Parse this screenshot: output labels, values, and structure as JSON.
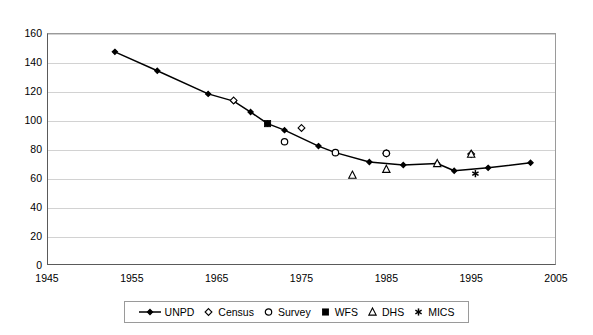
{
  "chart_data": {
    "type": "line",
    "title": "",
    "subtitle": "",
    "xlabel": "",
    "ylabel": "",
    "xlim": [
      1945,
      2005
    ],
    "ylim": [
      0,
      160
    ],
    "xticks": [
      1945,
      1955,
      1965,
      1975,
      1985,
      1995,
      2005
    ],
    "yticks": [
      0,
      20,
      40,
      60,
      80,
      100,
      120,
      140,
      160
    ],
    "grid": "horizontal",
    "legend_position": "bottom-center",
    "series": [
      {
        "name": "UNPD",
        "marker": "filled-diamond",
        "line": true,
        "color": "#000000",
        "points": [
          [
            1953,
            147
          ],
          [
            1958,
            134
          ],
          [
            1964,
            118
          ],
          [
            1967,
            113
          ],
          [
            1969,
            105.5
          ],
          [
            1971,
            97.5
          ],
          [
            1973,
            93
          ],
          [
            1977,
            82
          ],
          [
            1979,
            77.5
          ],
          [
            1983,
            71
          ],
          [
            1987,
            69
          ],
          [
            1991,
            70
          ],
          [
            1993,
            65
          ],
          [
            1997,
            67
          ],
          [
            2002,
            70.5
          ]
        ]
      },
      {
        "name": "Census",
        "marker": "open-diamond",
        "line": false,
        "color": "#000000",
        "points": [
          [
            1967,
            113.5
          ],
          [
            1975,
            94.5
          ],
          [
            1985,
            77
          ],
          [
            1995,
            76.5
          ]
        ]
      },
      {
        "name": "Survey",
        "marker": "open-circle",
        "line": false,
        "color": "#000000",
        "points": [
          [
            1973,
            85
          ],
          [
            1979,
            77.5
          ],
          [
            1985,
            77
          ]
        ]
      },
      {
        "name": "WFS",
        "marker": "filled-square",
        "line": false,
        "color": "#000000",
        "points": [
          [
            1971,
            97.5
          ]
        ]
      },
      {
        "name": "DHS",
        "marker": "open-triangle",
        "line": false,
        "color": "#000000",
        "points": [
          [
            1981,
            62
          ],
          [
            1985,
            66
          ],
          [
            1991,
            70
          ],
          [
            1995,
            76.5
          ]
        ]
      },
      {
        "name": "MICS",
        "marker": "asterisk",
        "line": false,
        "color": "#000000",
        "points": [
          [
            1995.5,
            63
          ]
        ]
      }
    ]
  },
  "legend": {
    "items": [
      {
        "label": "UNPD",
        "marker": "line-filled-diamond"
      },
      {
        "label": "Census",
        "marker": "open-diamond"
      },
      {
        "label": "Survey",
        "marker": "open-circle"
      },
      {
        "label": "WFS",
        "marker": "filled-square"
      },
      {
        "label": "DHS",
        "marker": "open-triangle"
      },
      {
        "label": "MICS",
        "marker": "asterisk"
      }
    ]
  },
  "axes": {
    "y_tick_labels": [
      "160",
      "140",
      "120",
      "100",
      "80",
      "60",
      "40",
      "20",
      "0"
    ],
    "x_tick_labels": [
      "1945",
      "1955",
      "1965",
      "1975",
      "1985",
      "1995",
      "2005"
    ]
  }
}
